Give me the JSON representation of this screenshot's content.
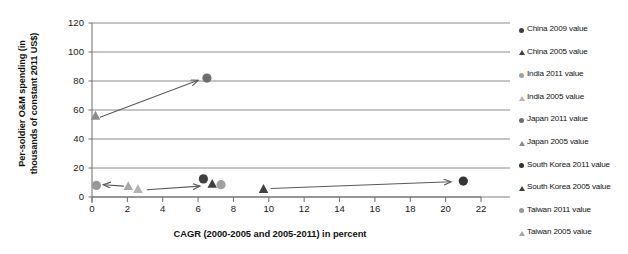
{
  "chart_data": {
    "type": "scatter",
    "title": "",
    "xlabel": "CAGR (2000-2005 and 2005-2011) in percent",
    "ylabel": "Per-soldier O&M spending (in\nthousands of constant 2011 US$)",
    "xlim": [
      0,
      22
    ],
    "ylim": [
      0,
      120
    ],
    "xticks": [
      0,
      2,
      4,
      6,
      8,
      10,
      12,
      14,
      16,
      18,
      20,
      22
    ],
    "yticks": [
      0,
      20,
      40,
      60,
      80,
      100,
      120
    ],
    "grid": "horizontal",
    "legend_position": "right",
    "series": [
      {
        "name": "China 2009 value",
        "marker": "circle",
        "color": "#3f3f3f",
        "points": [
          {
            "x": 6.3,
            "y": 12.5
          }
        ]
      },
      {
        "name": "China 2005 value",
        "marker": "triangle",
        "color": "#3f3f3f",
        "points": [
          {
            "x": 6.8,
            "y": 9.0
          }
        ]
      },
      {
        "name": "India 2011 value",
        "marker": "circle",
        "color": "#a0a0a0",
        "points": [
          {
            "x": 7.3,
            "y": 8.5
          }
        ]
      },
      {
        "name": "India 2005 value",
        "marker": "triangle",
        "color": "#b4b4b4",
        "points": [
          {
            "x": 2.6,
            "y": 5.5
          }
        ]
      },
      {
        "name": "Japan 2011 value",
        "marker": "circle",
        "color": "#6e6e6e",
        "points": [
          {
            "x": 6.5,
            "y": 82.0
          }
        ]
      },
      {
        "name": "Japan 2005 value",
        "marker": "triangle",
        "color": "#8c8c8c",
        "points": [
          {
            "x": 0.2,
            "y": 56.0
          }
        ]
      },
      {
        "name": "South Korea 2011 value",
        "marker": "circle",
        "color": "#333333",
        "points": [
          {
            "x": 21.0,
            "y": 11.0
          }
        ]
      },
      {
        "name": "South Korea 2005 value",
        "marker": "triangle",
        "color": "#3f3f3f",
        "points": [
          {
            "x": 9.7,
            "y": 5.5
          }
        ]
      },
      {
        "name": "Taiwan 2011 value",
        "marker": "circle",
        "color": "#989898",
        "points": [
          {
            "x": 0.25,
            "y": 8.0
          }
        ]
      },
      {
        "name": "Taiwan 2005 value",
        "marker": "triangle",
        "color": "#a8a8a8",
        "points": [
          {
            "x": 2.05,
            "y": 7.5
          }
        ]
      }
    ],
    "annotations": [
      {
        "name": "japan-arrow",
        "from": {
          "x": 0.45,
          "y": 55.0
        },
        "to": {
          "x": 6.0,
          "y": 80.5
        }
      },
      {
        "name": "china-arrow",
        "from": {
          "x": 3.1,
          "y": 5.0
        },
        "to": {
          "x": 6.1,
          "y": 7.5
        }
      },
      {
        "name": "taiwan-arrow",
        "from": {
          "x": 1.8,
          "y": 7.5
        },
        "to": {
          "x": 0.65,
          "y": 8.5
        }
      },
      {
        "name": "south-korea-arrow",
        "from": {
          "x": 10.1,
          "y": 5.8
        },
        "to": {
          "x": 20.3,
          "y": 10.5
        }
      }
    ]
  },
  "axes": {
    "y_tick_labels": [
      "120",
      "100",
      "80",
      "60",
      "40",
      "20",
      "0"
    ],
    "x_tick_labels": [
      "0",
      "2",
      "4",
      "6",
      "8",
      "10",
      "12",
      "14",
      "16",
      "18",
      "20",
      "22"
    ],
    "x_title": "CAGR (2000-2005 and 2005-2011) in percent",
    "y_title": "Per-soldier O&M spending (in\nthousands of constant 2011 US$)"
  },
  "legend": {
    "items": [
      {
        "label": "China 2009 value",
        "marker": "circle",
        "color": "#3f3f3f"
      },
      {
        "label": "China 2005 value",
        "marker": "triangle",
        "color": "#3f3f3f"
      },
      {
        "label": "India 2011 value",
        "marker": "circle",
        "color": "#a0a0a0"
      },
      {
        "label": "India 2005 value",
        "marker": "triangle",
        "color": "#b4b4b4"
      },
      {
        "label": "Japan 2011 value",
        "marker": "circle",
        "color": "#6e6e6e"
      },
      {
        "label": "Japan 2005 value",
        "marker": "triangle",
        "color": "#8c8c8c"
      },
      {
        "label": "South Korea 2011 value",
        "marker": "circle",
        "color": "#333333"
      },
      {
        "label": "South Korea 2005 value",
        "marker": "triangle",
        "color": "#3f3f3f"
      },
      {
        "label": "Taiwan 2011 value",
        "marker": "circle",
        "color": "#989898"
      },
      {
        "label": "Taiwan 2005 value",
        "marker": "triangle",
        "color": "#a8a8a8"
      }
    ]
  },
  "colors": {
    "grid": "#808080",
    "axis": "#6e6e6e",
    "arrow": "#595959",
    "text": "#111111"
  }
}
